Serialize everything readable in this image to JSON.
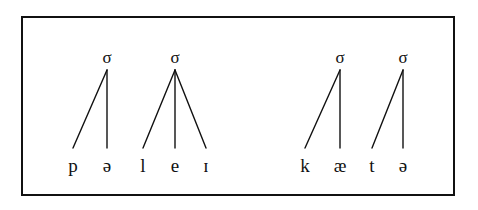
{
  "figure": {
    "frame": {
      "border_color": "#111111",
      "background_color": "#ffffff",
      "x": 21,
      "y": 16,
      "width": 434,
      "height": 180,
      "border_width": 2
    },
    "ink_color": "#111111",
    "branch_width": 1.4,
    "syllable_symbol": "σ",
    "words": [
      {
        "name": "word-1",
        "transcription": "pəleɪ",
        "syllables": [
          {
            "name": "syllable-1",
            "node_label": "σ",
            "node_x": 107,
            "node_y": 57,
            "apex_x": 107,
            "apex_y": 70,
            "segments": [
              {
                "label": "p",
                "x": 73,
                "y": 165
              },
              {
                "label": "ə",
                "x": 107,
                "y": 165
              }
            ]
          },
          {
            "name": "syllable-2",
            "node_label": "σ",
            "node_x": 175,
            "node_y": 57,
            "apex_x": 175,
            "apex_y": 70,
            "segments": [
              {
                "label": "l",
                "x": 143,
                "y": 165
              },
              {
                "label": "e",
                "x": 175,
                "y": 165
              },
              {
                "label": "ɪ",
                "x": 206,
                "y": 165
              }
            ]
          }
        ]
      },
      {
        "name": "word-2",
        "transcription": "kætə",
        "syllables": [
          {
            "name": "syllable-3",
            "node_label": "σ",
            "node_x": 340,
            "node_y": 57,
            "apex_x": 340,
            "apex_y": 70,
            "segments": [
              {
                "label": "k",
                "x": 305,
                "y": 165
              },
              {
                "label": "æ",
                "x": 340,
                "y": 165
              }
            ]
          },
          {
            "name": "syllable-4",
            "node_label": "σ",
            "node_x": 403,
            "node_y": 57,
            "apex_x": 403,
            "apex_y": 70,
            "segments": [
              {
                "label": "t",
                "x": 372,
                "y": 165
              },
              {
                "label": "ə",
                "x": 403,
                "y": 165
              }
            ]
          }
        ]
      }
    ],
    "branch_bottom_y": 148
  }
}
